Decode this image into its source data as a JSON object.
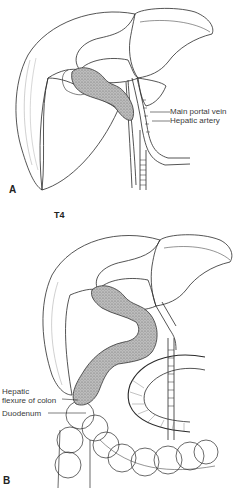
{
  "figure": {
    "stage_label": "T4",
    "panels": [
      {
        "letter": "A",
        "labels": [
          {
            "text": "Main portal vein"
          },
          {
            "text": "Hepatic artery"
          }
        ]
      },
      {
        "letter": "B",
        "labels": [
          {
            "text": "Hepatic"
          },
          {
            "text": "flexure of colon"
          },
          {
            "text": "Duodenum"
          }
        ]
      }
    ]
  },
  "colors": {
    "line": "#2a2a2a",
    "tumor_fill": "#9a9a9a",
    "label_text": "#3a3a3a",
    "background": "#ffffff"
  }
}
